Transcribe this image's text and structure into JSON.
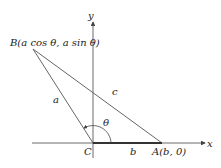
{
  "figure": {
    "axes": {
      "x_label": "x",
      "y_label": "y"
    },
    "points": {
      "B": {
        "label": "B(a cos θ, a sin θ)"
      },
      "C": {
        "label": "C"
      },
      "A": {
        "label": "A(b, 0)"
      }
    },
    "sides": {
      "a": "a",
      "b": "b",
      "c": "c"
    },
    "angle": {
      "label": "θ"
    },
    "colors": {
      "line": "#555555",
      "axis": "#444444",
      "text": "#222222"
    }
  }
}
